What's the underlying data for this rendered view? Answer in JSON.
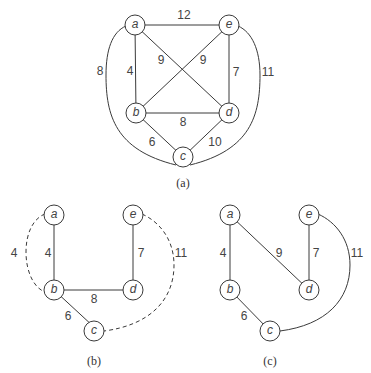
{
  "graphs": {
    "a": {
      "caption": "(a)",
      "nodes": {
        "a": "a",
        "b": "b",
        "c": "c",
        "d": "d",
        "e": "e"
      },
      "weights": {
        "ae": "12",
        "ab": "4",
        "ad": "9",
        "eb": "9",
        "ed": "7",
        "bd": "8",
        "bc": "6",
        "dc": "10",
        "ac": "8",
        "ec": "11"
      }
    },
    "b": {
      "caption": "(b)",
      "nodes": {
        "a": "a",
        "b": "b",
        "c": "c",
        "d": "d",
        "e": "e"
      },
      "weights": {
        "ab_solid": "4",
        "ab_dashed": "4",
        "ed": "7",
        "bd": "8",
        "bc": "6",
        "ec_dashed": "11"
      }
    },
    "c": {
      "caption": "(c)",
      "nodes": {
        "a": "a",
        "b": "b",
        "c": "c",
        "d": "d",
        "e": "e"
      },
      "weights": {
        "ab": "4",
        "ad": "9",
        "ed": "7",
        "bc": "6",
        "ec": "11"
      }
    }
  }
}
